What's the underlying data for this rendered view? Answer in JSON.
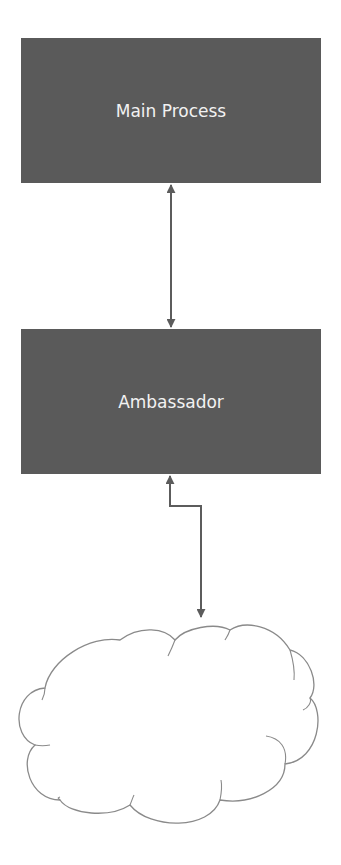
{
  "diagram": {
    "nodes": [
      {
        "id": "main-process",
        "label": "Main Process",
        "shape": "rectangle",
        "fill": "#5a5a5a",
        "text_color": "#f2f2f2"
      },
      {
        "id": "ambassador",
        "label": "Ambassador",
        "shape": "rectangle",
        "fill": "#5a5a5a",
        "text_color": "#f2f2f2"
      },
      {
        "id": "cloud",
        "label": "",
        "shape": "cloud",
        "fill": "#ffffff",
        "stroke": "#808080"
      }
    ],
    "edges": [
      {
        "from": "main-process",
        "to": "ambassador",
        "direction": "bidirectional",
        "style": "straight"
      },
      {
        "from": "ambassador",
        "to": "cloud",
        "direction": "bidirectional",
        "style": "elbow"
      }
    ],
    "colors": {
      "connector": "#5c5c5c",
      "background": "#ffffff"
    }
  }
}
